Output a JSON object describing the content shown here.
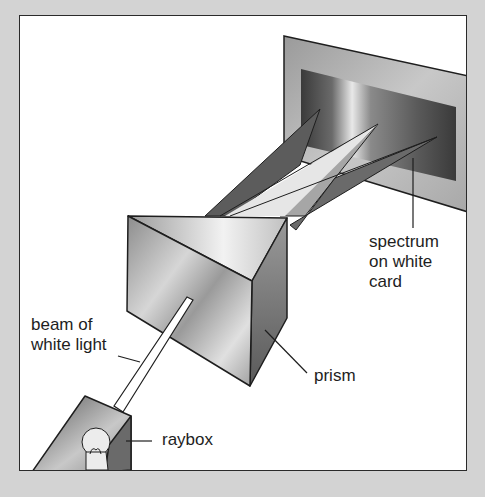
{
  "diagram": {
    "labels": {
      "spectrum": [
        "spectrum",
        "on white",
        "card"
      ],
      "beam": [
        "beam of",
        "white light"
      ],
      "prism": "prism",
      "raybox": "raybox"
    },
    "components": [
      "white card",
      "spectrum",
      "prism",
      "beam of white light",
      "raybox",
      "light bulb"
    ],
    "colors": {
      "background": "#d3d3d3",
      "frame": "#ffffff",
      "outline": "#1e1e1e"
    }
  }
}
